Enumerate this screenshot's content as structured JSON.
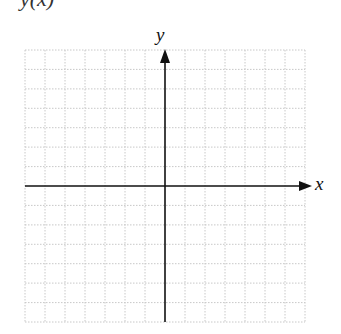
{
  "title": "y(x)",
  "axes": {
    "x_label": "x",
    "y_label": "y"
  },
  "grid": {
    "columns": 14,
    "rows": 14,
    "line_style": "dotted",
    "line_color": "#c8c8c8",
    "axis_color": "#111111"
  }
}
